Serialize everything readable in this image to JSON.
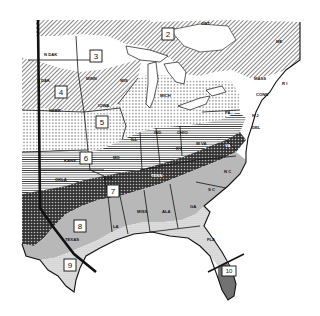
{
  "map": {
    "title": "",
    "colors": {
      "ink": "#111111",
      "paper": "#ffffff",
      "zone8_fill": "#b8b8b8",
      "zone9_fill": "#e4e4e4"
    },
    "zones": [
      {
        "id": "2",
        "label": "2",
        "pattern": "diagonal-hatch",
        "x": 168,
        "y": 34
      },
      {
        "id": "3",
        "label": "3",
        "pattern": "blank",
        "x": 96,
        "y": 56
      },
      {
        "id": "4",
        "label": "4",
        "pattern": "diagonal-hatch",
        "x": 61,
        "y": 92
      },
      {
        "id": "5",
        "label": "5",
        "pattern": "dot-stipple",
        "x": 102,
        "y": 122
      },
      {
        "id": "6",
        "label": "6",
        "pattern": "horizontal-lines",
        "x": 86,
        "y": 158
      },
      {
        "id": "7",
        "label": "7",
        "pattern": "crosshatch",
        "x": 113,
        "y": 191
      },
      {
        "id": "8",
        "label": "8",
        "pattern": "gray-tone",
        "x": 80,
        "y": 226
      },
      {
        "id": "9",
        "label": "9",
        "pattern": "fine-stipple",
        "x": 70,
        "y": 265
      },
      {
        "id": "10",
        "label": "10",
        "pattern": "vertical-lines",
        "x": 229,
        "y": 271
      }
    ],
    "states": [
      {
        "label": "N DAK",
        "x": 44,
        "y": 56
      },
      {
        "label": "S DAK",
        "x": 37,
        "y": 82
      },
      {
        "label": "NEBR",
        "x": 49,
        "y": 112
      },
      {
        "label": "MINN",
        "x": 86,
        "y": 80
      },
      {
        "label": "WIS",
        "x": 120,
        "y": 82
      },
      {
        "label": "IOWA",
        "x": 98,
        "y": 107
      },
      {
        "label": "KANS",
        "x": 64,
        "y": 162
      },
      {
        "label": "MO",
        "x": 113,
        "y": 159
      },
      {
        "label": "ILL",
        "x": 131,
        "y": 141
      },
      {
        "label": "IND",
        "x": 154,
        "y": 134
      },
      {
        "label": "OHIO",
        "x": 177,
        "y": 134
      },
      {
        "label": "MICH",
        "x": 160,
        "y": 97
      },
      {
        "label": "PA",
        "x": 225,
        "y": 114
      },
      {
        "label": "W VA",
        "x": 196,
        "y": 145
      },
      {
        "label": "VA",
        "x": 225,
        "y": 147
      },
      {
        "label": "KY",
        "x": 176,
        "y": 150
      },
      {
        "label": "TENN",
        "x": 151,
        "y": 177
      },
      {
        "label": "OKLA",
        "x": 55,
        "y": 181
      },
      {
        "label": "ARK",
        "x": 104,
        "y": 180
      },
      {
        "label": "N C",
        "x": 224,
        "y": 173
      },
      {
        "label": "S C",
        "x": 208,
        "y": 191
      },
      {
        "label": "GA",
        "x": 190,
        "y": 208
      },
      {
        "label": "ALA",
        "x": 162,
        "y": 213
      },
      {
        "label": "MISS",
        "x": 137,
        "y": 213
      },
      {
        "label": "LA",
        "x": 113,
        "y": 228
      },
      {
        "label": "TEXAS",
        "x": 65,
        "y": 241
      },
      {
        "label": "FLA",
        "x": 207,
        "y": 241
      },
      {
        "label": "CONN",
        "x": 256,
        "y": 96
      },
      {
        "label": "MASS",
        "x": 254,
        "y": 80
      },
      {
        "label": "R I",
        "x": 282,
        "y": 85
      },
      {
        "label": "N J",
        "x": 252,
        "y": 117
      },
      {
        "label": "DEL",
        "x": 252,
        "y": 129
      },
      {
        "label": "ME",
        "x": 276,
        "y": 43
      },
      {
        "label": "ONT",
        "x": 201,
        "y": 25
      }
    ]
  }
}
